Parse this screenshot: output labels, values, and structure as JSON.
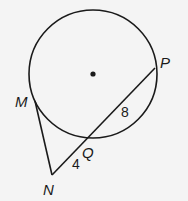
{
  "diagram": {
    "circle": {
      "cx": 93,
      "cy": 74,
      "r": 64
    },
    "center_dot": {
      "cx": 93,
      "cy": 74,
      "r": 2.6
    },
    "points": {
      "M": {
        "label": "M",
        "x": 35,
        "y": 101,
        "lx": 15,
        "ly": 107
      },
      "N": {
        "label": "N",
        "x": 52,
        "y": 175,
        "lx": 43,
        "ly": 195
      },
      "Q": {
        "label": "Q",
        "x": 88,
        "y": 139,
        "lx": 82,
        "ly": 158
      },
      "P": {
        "label": "P",
        "x": 155,
        "y": 68,
        "lx": 160,
        "ly": 68
      }
    },
    "segment_labels": {
      "NQ": {
        "text": "4",
        "x": 72,
        "y": 169
      },
      "QP": {
        "text": "8",
        "x": 121,
        "y": 117
      }
    },
    "stroke_color": "#1a1a1a",
    "background_color": "#f4f4f4"
  }
}
